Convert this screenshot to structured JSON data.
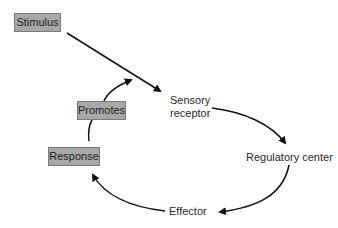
{
  "diagram": {
    "type": "feedback-loop",
    "nodes": {
      "stimulus": "Stimulus",
      "sensory_receptor_line1": "Sensory",
      "sensory_receptor_line2": "receptor",
      "regulatory_center": "Regulatory center",
      "effector": "Effector",
      "response": "Response",
      "promotes": "Promotes"
    },
    "edges": [
      {
        "from": "Stimulus",
        "to": "Sensory receptor"
      },
      {
        "from": "Sensory receptor",
        "to": "Regulatory center"
      },
      {
        "from": "Regulatory center",
        "to": "Effector"
      },
      {
        "from": "Effector",
        "to": "Response"
      },
      {
        "from": "Response",
        "to": "Promotes"
      },
      {
        "from": "Promotes",
        "to": "Stimulus pathway"
      }
    ],
    "colors": {
      "box_fill": "#a8a8a8",
      "box_border": "#7a7a7a",
      "arrow": "#111111"
    }
  }
}
